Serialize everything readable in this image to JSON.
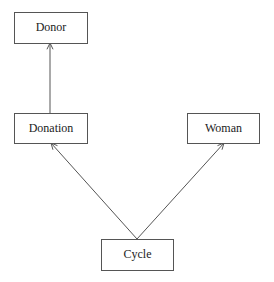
{
  "diagram": {
    "type": "class-dependency",
    "nodes": [
      {
        "id": "donor",
        "label": "Donor",
        "x": 14,
        "y": 12,
        "w": 73,
        "h": 31
      },
      {
        "id": "donation",
        "label": "Donation",
        "x": 14,
        "y": 113,
        "w": 73,
        "h": 30
      },
      {
        "id": "woman",
        "label": "Woman",
        "x": 187,
        "y": 113,
        "w": 72,
        "h": 30
      },
      {
        "id": "cycle",
        "label": "Cycle",
        "x": 101,
        "y": 239,
        "w": 72,
        "h": 31
      }
    ],
    "edges": [
      {
        "from": "donation",
        "to": "donor",
        "x1": 50,
        "y1": 113,
        "x2": 50,
        "y2": 43,
        "arrow": "open"
      },
      {
        "from": "cycle",
        "to": "donation",
        "x1": 137,
        "y1": 239,
        "x2": 51,
        "y2": 143,
        "arrow": "open"
      },
      {
        "from": "cycle",
        "to": "woman",
        "x1": 137,
        "y1": 239,
        "x2": 224,
        "y2": 143,
        "arrow": "open"
      }
    ],
    "colors": {
      "stroke": "#555555",
      "text": "#222222",
      "background": "#ffffff"
    }
  }
}
